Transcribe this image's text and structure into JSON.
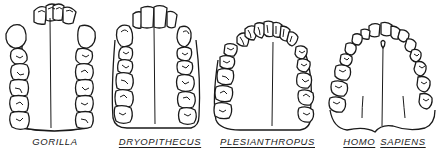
{
  "figure": {
    "type": "comparative dental arch diagram",
    "stroke_color": "#1a1a1a",
    "background": "#ffffff",
    "panels": [
      {
        "id": "gorilla",
        "label_words": [
          "GORILLA"
        ],
        "underlined": [
          false
        ],
        "arch_shape": "U-shaped, parallel tooth rows, large canines"
      },
      {
        "id": "dryopithecus",
        "label_words": [
          "DRYOPITHECUS"
        ],
        "underlined": [
          true
        ],
        "arch_shape": "U-shaped, parallel tooth rows"
      },
      {
        "id": "plesianthropus",
        "label_words": [
          "PLESIANTHROPUS"
        ],
        "underlined": [
          true
        ],
        "arch_shape": "rounded parabolic arch"
      },
      {
        "id": "homo-sapiens",
        "label_words": [
          "HOMO",
          "SAPIENS"
        ],
        "underlined": [
          true,
          true
        ],
        "arch_shape": "parabolic arch, divergent tooth rows"
      }
    ]
  }
}
